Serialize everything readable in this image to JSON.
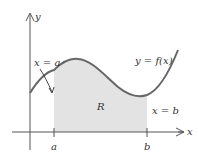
{
  "diagram": {
    "axes": {
      "x_label": "x",
      "y_label": "y"
    },
    "curve_label": "y = f(x)",
    "region_label": "R",
    "left_bound_label": "x = a",
    "right_bound_label": "x = b",
    "tick_a": "a",
    "tick_b": "b",
    "colors": {
      "curve": "#666666",
      "region": "#e3e3e3",
      "axis": "#555555",
      "text": "#333333"
    }
  }
}
